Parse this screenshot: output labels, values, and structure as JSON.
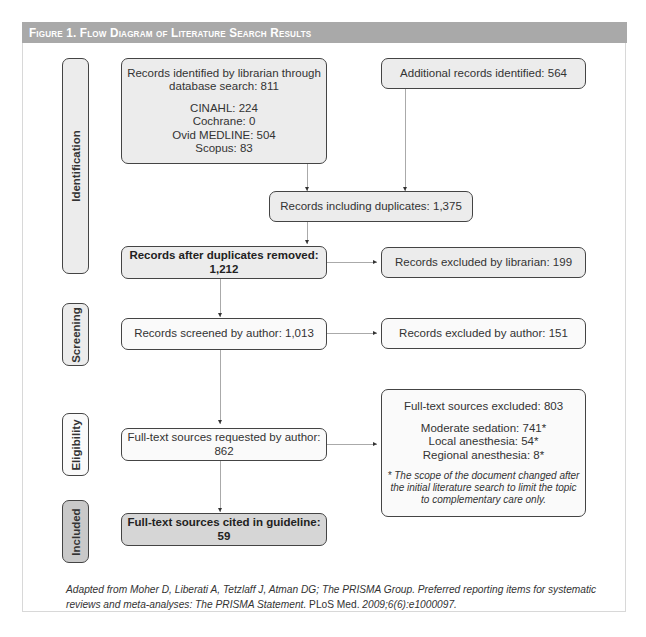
{
  "figure": {
    "title": "Figure 1. Flow Diagram of Literature Search Results",
    "header_color": "#a9a9a9"
  },
  "stages": [
    {
      "label": "Identification"
    },
    {
      "label": "Screening"
    },
    {
      "label": "Eligibility"
    },
    {
      "label": "Included"
    }
  ],
  "boxes": {
    "librarian_search": {
      "title_line1": "Records identified by librarian through",
      "title_line2": "database search: 811",
      "sources": [
        "CINAHL: 224",
        "Cochrane: 0",
        "Ovid MEDLINE: 504",
        "Scopus: 83"
      ]
    },
    "additional": {
      "text": "Additional records identified: 564"
    },
    "including_duplicates": {
      "text": "Records including duplicates: 1,375"
    },
    "after_duplicates": {
      "text": "Records after duplicates removed: 1,212"
    },
    "excluded_librarian": {
      "text": "Records excluded by librarian: 199"
    },
    "screened": {
      "text": "Records screened by author: 1,013"
    },
    "excluded_author": {
      "text": "Records excluded by author: 151"
    },
    "requested": {
      "text": "Full-text sources requested by author: 862"
    },
    "fulltext_excluded": {
      "title": "Full-text sources excluded: 803",
      "reasons": [
        "Moderate sedation: 741*",
        "Local anesthesia: 54*",
        "Regional anesthesia: 8*"
      ],
      "note_line1": "* The scope of the document changed after",
      "note_line2": "the initial literature search to limit the topic",
      "note_line3": "to complementary care only."
    },
    "cited": {
      "text": "Full-text sources cited in guideline: 59"
    }
  },
  "caption": {
    "part1": "Adapted from Moher D, Liberati A, Tetzlaff J, Atman DG; The PRISMA Group. Preferred reporting items for systematic reviews and meta-analyses: The PRISMA Statement.",
    "journal": " PLoS Med. ",
    "part2": "2009;6(6):e1000097."
  }
}
